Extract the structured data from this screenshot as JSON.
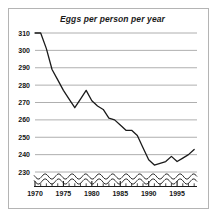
{
  "figure": {
    "background": "#ffffff",
    "border_color": "#b4b4b4"
  },
  "chart_data": {
    "type": "line",
    "title": "Eggs per person per year",
    "xlabel": "",
    "ylabel": "",
    "xlim": [
      1970,
      1998.5
    ],
    "ylim": [
      230,
      310
    ],
    "grid": true,
    "legend": null,
    "axis_break": {
      "present": true,
      "style": "wavy-double-line",
      "below_value": 230,
      "note": "y-axis truncated below 230"
    },
    "line_color": "#1a1a1a",
    "grid_color": "#9a9a9a",
    "yticks": [
      310,
      300,
      290,
      280,
      270,
      260,
      250,
      240,
      230
    ],
    "ytick_labels": [
      "310",
      "300",
      "290",
      "280",
      "270",
      "260",
      "250",
      "240",
      "230"
    ],
    "xticks": [
      1970,
      1975,
      1980,
      1985,
      1990,
      1995
    ],
    "xtick_labels": [
      "1970",
      "1975",
      "1980",
      "1985",
      "1990",
      "1995"
    ],
    "xminor_ticks": [
      1971,
      1972,
      1973,
      1974,
      1976,
      1977,
      1978,
      1979,
      1981,
      1982,
      1983,
      1984,
      1986,
      1987,
      1988,
      1989,
      1991,
      1992,
      1993,
      1994,
      1996,
      1997,
      1998
    ],
    "x": [
      1970,
      1971,
      1972,
      1973,
      1974,
      1975,
      1976,
      1977,
      1978,
      1979,
      1980,
      1981,
      1982,
      1983,
      1984,
      1985,
      1986,
      1987,
      1988,
      1989,
      1990,
      1991,
      1992,
      1993,
      1994,
      1995,
      1996,
      1997,
      1998
    ],
    "values": [
      310,
      310,
      301,
      289,
      283,
      277,
      272,
      267,
      272,
      277,
      271,
      268,
      266,
      261,
      260,
      257,
      254,
      254,
      251,
      244,
      237,
      234,
      235,
      236,
      239,
      236,
      238,
      240,
      243
    ],
    "series": [
      {
        "name": "Eggs per person per year",
        "values": [
          310,
          310,
          301,
          289,
          283,
          277,
          272,
          267,
          272,
          277,
          271,
          268,
          266,
          261,
          260,
          257,
          254,
          254,
          251,
          244,
          237,
          234,
          235,
          236,
          239,
          236,
          238,
          240,
          243
        ]
      }
    ]
  }
}
